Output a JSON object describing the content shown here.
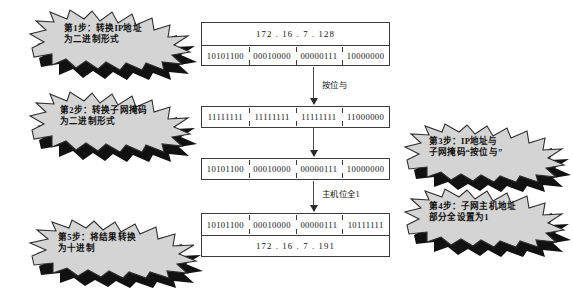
{
  "diagram": {
    "colors": {
      "burst_fill": "#d4d4d4",
      "burst_stroke": "#2f2f2f",
      "burst_shadow": "#0a0a0a",
      "table_stroke": "#3a3a3a",
      "text": "#111111"
    },
    "steps": [
      {
        "id": "step1",
        "line1": "第1步：转换IP地址",
        "line2": "为二进制形式"
      },
      {
        "id": "step2",
        "line1": "第2步：转换子网掩码",
        "line2": "为二进制形式"
      },
      {
        "id": "step3",
        "line1": "第3步：IP地址与",
        "line2": "子网掩码“按位与”"
      },
      {
        "id": "step4",
        "line1": "第4步：子网主机地址",
        "line2": "部分全设置为1"
      },
      {
        "id": "step5",
        "line1": "第5步：将结果转换",
        "line2": "为十进制"
      }
    ],
    "tables": {
      "ip_decimal": "172 . 16 . 7 . 128",
      "ip_binary": [
        "10101100",
        "00010000",
        "00000111",
        "10000000"
      ],
      "mask_binary": [
        "11111111",
        "11111111",
        "11111111",
        "11000000"
      ],
      "and_result_binary": [
        "10101100",
        "00010000",
        "00000111",
        "10000000"
      ],
      "broadcast_binary": [
        "10101100",
        "00010000",
        "00000111",
        "10111111"
      ],
      "broadcast_decimal": "172 . 16 . 7 . 191"
    },
    "arrows": [
      {
        "id": "arrow-and",
        "label": "按位与"
      },
      {
        "id": "arrow-host-bits",
        "label": "主机位全1"
      }
    ]
  }
}
